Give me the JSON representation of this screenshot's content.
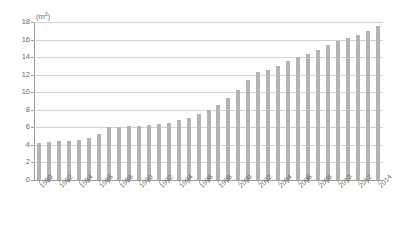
{
  "chart_data": {
    "type": "bar",
    "title": "",
    "subtitle": "",
    "xlabel": "",
    "ylabel": "",
    "unit_label": "(m2)",
    "unit_base": "(m",
    "unit_sup": "2",
    "unit_close": ")",
    "ylim": [
      0,
      18
    ],
    "ytick_step": 2,
    "yticks": [
      0,
      2,
      4,
      6,
      8,
      10,
      12,
      14,
      16,
      18
    ],
    "grid": true,
    "legend": "none",
    "bar_color": "#b3b3b3",
    "grid_color": "#d2d2d2",
    "axis_color": "#9a9a9a",
    "text_color": "#6b6b6b",
    "background": "#ffffff",
    "label_every": 2,
    "categories": [
      "1980",
      "1981",
      "1982",
      "1983",
      "1984",
      "1985",
      "1986",
      "1987",
      "1988",
      "1989",
      "1990",
      "1991",
      "1992",
      "1993",
      "1994",
      "1995",
      "1996",
      "1997",
      "1998",
      "1999",
      "2000",
      "2001",
      "2002",
      "2003",
      "2004",
      "2005",
      "2006",
      "2007",
      "2008",
      "2009",
      "2010",
      "2011",
      "2012",
      "2013",
      "2014"
    ],
    "values": [
      4.2,
      4.3,
      4.4,
      4.5,
      4.6,
      4.8,
      5.2,
      6.0,
      6.0,
      6.1,
      6.2,
      6.3,
      6.4,
      6.5,
      6.8,
      7.1,
      7.5,
      8.0,
      8.6,
      9.3,
      10.3,
      11.4,
      12.3,
      12.5,
      13.0,
      13.6,
      14.0,
      14.3,
      14.8,
      15.4,
      15.8,
      16.2,
      16.5,
      17.0,
      17.6
    ],
    "tick_labels": [
      "1980",
      "1982",
      "1984",
      "1986",
      "1988",
      "1990",
      "1992",
      "1994",
      "1996",
      "1998",
      "2000",
      "2002",
      "2004",
      "2006",
      "2008",
      "2010",
      "2012",
      "2014"
    ]
  }
}
